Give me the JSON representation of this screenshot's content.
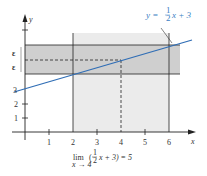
{
  "figure": {
    "equation_label": "y = ½ x + 3",
    "equation_parts": {
      "lhs": "y =",
      "num": "1",
      "den": "2",
      "rhs": "x + 3"
    },
    "axis_x_label": "x",
    "axis_y_label": "y",
    "x_ticks": [
      "1",
      "2",
      "3",
      "4",
      "5",
      "6"
    ],
    "y_ticks": [
      "1",
      "2",
      "3"
    ],
    "epsilon_upper": "ε",
    "epsilon_lower": "ε",
    "caption": {
      "lim": "lim",
      "sub": "x → 4",
      "open": "(",
      "num": "1",
      "den": "2",
      "rest": "x + 3) = 5"
    },
    "colors": {
      "line": "#2f6db5",
      "band_dark": "#cfcfcf",
      "band_light": "#ebebeb",
      "axis": "#222222"
    }
  }
}
